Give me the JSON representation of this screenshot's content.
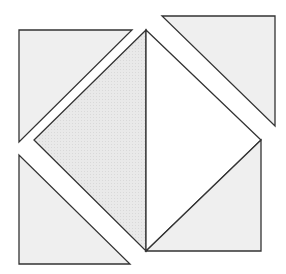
{
  "diagram": {
    "colors": {
      "background": "#ffffff",
      "stroke": "#333333",
      "light_fill": "#efefef",
      "shaded_fill": "#e6e6e6",
      "white_fill": "#ffffff"
    },
    "shapes": [
      {
        "id": "top-left-triangle",
        "points": "19,30 132,30 19,142",
        "fill": "#efefef"
      },
      {
        "id": "top-right-triangle",
        "points": "162,16 275,16 275,126",
        "fill": "#efefef"
      },
      {
        "id": "bottom-left-triangle",
        "points": "19,155 19,264 130,264",
        "fill": "#efefef"
      },
      {
        "id": "diamond-left-half",
        "points": "146,30 34,140 146,251",
        "fill": "#e6e6e6"
      },
      {
        "id": "diamond-right-half",
        "points": "146,30 261,140 146,251",
        "fill": "#ffffff"
      },
      {
        "id": "bottom-right-triangle",
        "points": "146,251 261,140 261,251",
        "fill": "#efefef"
      }
    ]
  }
}
